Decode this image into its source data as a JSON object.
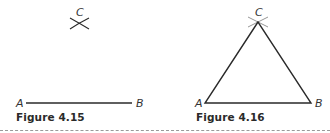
{
  "figures": [
    {
      "caption": "Figure 4.15",
      "points": {
        "A": "A",
        "B": "B",
        "C": "C"
      },
      "description": "Line segment AB with intersecting arcs marking point C above"
    },
    {
      "caption": "Figure 4.16",
      "points": {
        "A": "A",
        "B": "B",
        "C": "C"
      },
      "description": "Equilateral triangle ABC constructed from AB with arcs crossing at C"
    }
  ],
  "colors": {
    "stroke": "#2a2a2a",
    "divider": "#9a9a9a"
  }
}
